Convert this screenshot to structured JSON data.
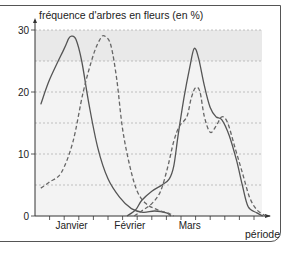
{
  "chart_data": {
    "type": "line",
    "title": "",
    "ylabel": "fréquence d'arbres en fleurs (en %)",
    "xlabel": "période",
    "ylim": [
      0,
      30
    ],
    "yticks": [
      0,
      10,
      20,
      30
    ],
    "x_month_labels": [
      "Janvier",
      "Février",
      "Mars"
    ],
    "grid": true,
    "grid_y": [
      5,
      10,
      15,
      20,
      25,
      30
    ],
    "shaded_plot_area": true,
    "legend": null,
    "x_units": "ticks (0 = origin, ~15 ticks along axis)",
    "series": [
      {
        "name": "solid-line-early",
        "style": "solid",
        "points": [
          [
            0.4,
            18
          ],
          [
            1,
            22
          ],
          [
            2,
            27
          ],
          [
            2.3,
            28.6
          ],
          [
            2.5,
            29
          ],
          [
            2.8,
            28.5
          ],
          [
            3.2,
            25
          ],
          [
            3.7,
            18
          ],
          [
            4.3,
            11
          ],
          [
            5,
            6
          ],
          [
            5.8,
            3
          ],
          [
            6.6,
            1.2
          ],
          [
            7.4,
            0.6
          ],
          [
            8.2,
            0.8
          ],
          [
            9,
            0.5
          ],
          [
            9.3,
            0
          ]
        ]
      },
      {
        "name": "dashed-line-early",
        "style": "dashed",
        "points": [
          [
            0.4,
            4.5
          ],
          [
            1,
            5.5
          ],
          [
            1.8,
            7
          ],
          [
            2.6,
            12
          ],
          [
            3.3,
            20
          ],
          [
            4,
            26
          ],
          [
            4.5,
            28.7
          ],
          [
            4.8,
            29
          ],
          [
            5.2,
            27.5
          ],
          [
            5.6,
            22
          ],
          [
            6,
            14
          ],
          [
            6.5,
            8
          ],
          [
            7,
            4
          ],
          [
            7.6,
            2
          ],
          [
            8.4,
            1
          ],
          [
            9.2,
            0.4
          ],
          [
            9.5,
            0
          ]
        ]
      },
      {
        "name": "solid-line-late",
        "style": "solid",
        "points": [
          [
            6.3,
            0
          ],
          [
            6.9,
            1
          ],
          [
            7.3,
            2.5
          ],
          [
            8,
            4
          ],
          [
            8.7,
            5
          ],
          [
            9.2,
            6
          ],
          [
            9.5,
            8
          ],
          [
            9.8,
            13
          ],
          [
            10.2,
            19
          ],
          [
            10.6,
            24
          ],
          [
            10.9,
            27
          ],
          [
            11.2,
            25.5
          ],
          [
            11.6,
            21
          ],
          [
            12,
            17.5
          ],
          [
            12.4,
            16
          ],
          [
            12.8,
            15.5
          ],
          [
            13.3,
            13
          ],
          [
            13.8,
            9
          ],
          [
            14.2,
            5
          ],
          [
            14.6,
            1.5
          ],
          [
            15.2,
            0.5
          ],
          [
            15.6,
            0
          ]
        ]
      },
      {
        "name": "dashed-line-late",
        "style": "dashed",
        "points": [
          [
            6.8,
            0
          ],
          [
            7.3,
            0.8
          ],
          [
            8,
            2
          ],
          [
            8.6,
            4
          ],
          [
            9.1,
            8
          ],
          [
            9.5,
            12
          ],
          [
            9.9,
            14.5
          ],
          [
            10.4,
            16
          ],
          [
            10.7,
            19
          ],
          [
            11,
            20.7
          ],
          [
            11.3,
            20
          ],
          [
            11.6,
            16
          ],
          [
            12,
            13.5
          ],
          [
            12.4,
            14.5
          ],
          [
            12.8,
            16
          ],
          [
            13.2,
            15
          ],
          [
            13.7,
            11
          ],
          [
            14.2,
            7
          ],
          [
            14.7,
            3
          ],
          [
            15.2,
            1
          ],
          [
            15.8,
            0
          ]
        ]
      }
    ]
  }
}
